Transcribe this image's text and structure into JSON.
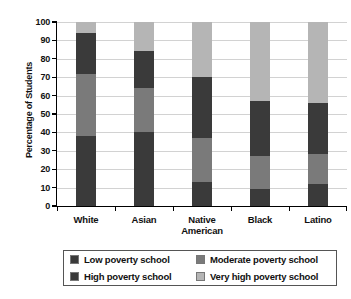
{
  "chart_data": {
    "type": "bar",
    "subtype": "stacked-percentage",
    "title": "",
    "xlabel": "",
    "ylabel": "Percentage of Students",
    "ylim": [
      0,
      100
    ],
    "ytick_step": 10,
    "ytick_labels": [
      "0",
      "10",
      "20",
      "30",
      "40",
      "50",
      "60",
      "70",
      "80",
      "90",
      "100"
    ],
    "grid": true,
    "grid_axis": "y",
    "legend_position": "below-axes",
    "categories": [
      "White",
      "Asian",
      "Native American",
      "Black",
      "Latino"
    ],
    "category_label_lines": [
      [
        "White"
      ],
      [
        "Asian"
      ],
      [
        "Native",
        "American"
      ],
      [
        "Black"
      ],
      [
        "Latino"
      ]
    ],
    "series": [
      {
        "name": "Low poverty school",
        "color": "#3a3a3a",
        "values": [
          38,
          40,
          13,
          9,
          12
        ]
      },
      {
        "name": "Moderate poverty school",
        "color": "#7a7a7a",
        "values": [
          34,
          24,
          24,
          18,
          16
        ]
      },
      {
        "name": "High poverty school",
        "color": "#3a3a3a",
        "values": [
          22,
          20,
          33,
          30,
          28
        ]
      },
      {
        "name": "Very high poverty school",
        "color": "#b5b5b5",
        "values": [
          6,
          16,
          30,
          43,
          44
        ]
      }
    ],
    "cumulative_tops": {
      "White": [
        38,
        72,
        94,
        100
      ],
      "Asian": [
        40,
        64,
        84,
        100
      ],
      "Native American": [
        13,
        37,
        70,
        100
      ],
      "Black": [
        9,
        27,
        57,
        100
      ],
      "Latino": [
        12,
        28,
        56,
        100
      ]
    }
  },
  "legend": {
    "items": [
      {
        "label": "Low poverty school",
        "color": "#3a3a3a"
      },
      {
        "label": "Moderate poverty school",
        "color": "#7a7a7a"
      },
      {
        "label": "High poverty school",
        "color": "#3a3a3a"
      },
      {
        "label": "Very high poverty school",
        "color": "#b5b5b5"
      }
    ]
  },
  "colors": {
    "axis": "#000000",
    "grid": "#d2d2d2",
    "background": "#ffffff",
    "legend_border": "#555555"
  }
}
